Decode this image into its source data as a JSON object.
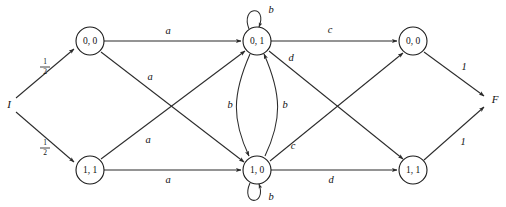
{
  "diagram": {
    "type": "state-machine",
    "colors": {
      "stroke": "#2b2b2b",
      "node_stroke": "#1a1a1a",
      "background": "#ffffff",
      "text": "#111111"
    },
    "terminals": {
      "initial": "I",
      "final": "F"
    },
    "nodes": [
      {
        "id": "n_tl",
        "label": "0, 0",
        "x": 90,
        "y": 41,
        "r": 14
      },
      {
        "id": "n_tm",
        "label": "0, 1",
        "x": 257,
        "y": 41,
        "r": 14
      },
      {
        "id": "n_tr",
        "label": "0, 0",
        "x": 413,
        "y": 41,
        "r": 14
      },
      {
        "id": "n_bl",
        "label": "1, 1",
        "x": 90,
        "y": 170,
        "r": 14
      },
      {
        "id": "n_bm",
        "label": "1, 0",
        "x": 257,
        "y": 170,
        "r": 14
      },
      {
        "id": "n_br",
        "label": "1, 1",
        "x": 413,
        "y": 170,
        "r": 14
      }
    ],
    "edges": [
      {
        "id": "e1",
        "from": "I",
        "to": "n_tl",
        "label": "1/2",
        "label_kind": "fraction",
        "numerator": "1",
        "denominator": "2",
        "shape": "straight"
      },
      {
        "id": "e2",
        "from": "I",
        "to": "n_bl",
        "label": "1/2",
        "label_kind": "fraction",
        "numerator": "1",
        "denominator": "2",
        "shape": "straight"
      },
      {
        "id": "e3",
        "from": "n_tl",
        "to": "n_tm",
        "label": "a",
        "label_kind": "symbol",
        "shape": "straight"
      },
      {
        "id": "e4",
        "from": "n_tl",
        "to": "n_bm",
        "label": "a",
        "label_kind": "symbol",
        "shape": "diagonal"
      },
      {
        "id": "e5",
        "from": "n_bl",
        "to": "n_tm",
        "label": "a",
        "label_kind": "symbol",
        "shape": "diagonal"
      },
      {
        "id": "e6",
        "from": "n_bl",
        "to": "n_bm",
        "label": "a",
        "label_kind": "symbol",
        "shape": "straight"
      },
      {
        "id": "e7",
        "from": "n_tm",
        "to": "n_tm",
        "label": "b",
        "label_kind": "symbol",
        "shape": "self-loop-top"
      },
      {
        "id": "e8",
        "from": "n_bm",
        "to": "n_bm",
        "label": "b",
        "label_kind": "symbol",
        "shape": "self-loop-bottom"
      },
      {
        "id": "e9",
        "from": "n_tm",
        "to": "n_bm",
        "label": "b",
        "label_kind": "symbol",
        "shape": "curve-left"
      },
      {
        "id": "e10",
        "from": "n_bm",
        "to": "n_tm",
        "label": "b",
        "label_kind": "symbol",
        "shape": "curve-right"
      },
      {
        "id": "e11",
        "from": "n_tm",
        "to": "n_tr",
        "label": "c",
        "label_kind": "symbol",
        "shape": "straight"
      },
      {
        "id": "e12",
        "from": "n_bm",
        "to": "n_tr",
        "label": "c",
        "label_kind": "symbol",
        "shape": "diagonal"
      },
      {
        "id": "e13",
        "from": "n_tm",
        "to": "n_br",
        "label": "d",
        "label_kind": "symbol",
        "shape": "diagonal"
      },
      {
        "id": "e14",
        "from": "n_bm",
        "to": "n_br",
        "label": "d",
        "label_kind": "symbol",
        "shape": "straight"
      },
      {
        "id": "e15",
        "from": "n_tr",
        "to": "F",
        "label": "1",
        "label_kind": "number",
        "shape": "straight"
      },
      {
        "id": "e16",
        "from": "n_br",
        "to": "F",
        "label": "1",
        "label_kind": "number",
        "shape": "straight"
      }
    ]
  }
}
